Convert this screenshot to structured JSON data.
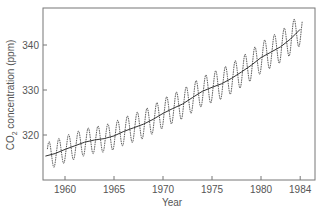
{
  "chart_data": {
    "type": "line",
    "title": "",
    "xlabel": "Year",
    "ylabel": "CO2 concentration (ppm)",
    "ylabel_parts": {
      "main": "CO",
      "sub": "2",
      "rest": " concentration (ppm)"
    },
    "xlim": [
      1957.75,
      1985.5
    ],
    "ylim": [
      310,
      348.5
    ],
    "x_ticks": [
      1960,
      1965,
      1970,
      1975,
      1980,
      1984
    ],
    "y_ticks": [
      320,
      330,
      340
    ],
    "grid": false,
    "legend": null,
    "series": [
      {
        "name": "Monthly CO2 (seasonal cycle)",
        "style": "dotted-line",
        "seasonal_amplitude_ppm": [
          3.0,
          3.0,
          3.0,
          3.0,
          3.0,
          3.0,
          3.0,
          3.1,
          3.1,
          3.2,
          3.2,
          3.2,
          3.3,
          3.3,
          3.3,
          3.3,
          3.3,
          3.4,
          3.4,
          3.4,
          3.4,
          3.4,
          3.5,
          3.5,
          3.5,
          3.6,
          3.6
        ]
      },
      {
        "name": "Trend",
        "style": "solid-line",
        "x": [
          1958,
          1959,
          1960,
          1961,
          1962,
          1963,
          1964,
          1965,
          1966,
          1967,
          1968,
          1969,
          1970,
          1971,
          1972,
          1973,
          1974,
          1975,
          1976,
          1977,
          1978,
          1979,
          1980,
          1981,
          1982,
          1983,
          1984
        ],
        "values": [
          315.3,
          315.9,
          316.8,
          317.6,
          318.4,
          318.9,
          319.2,
          319.8,
          320.8,
          321.6,
          322.4,
          323.5,
          324.8,
          325.9,
          326.9,
          328.3,
          329.7,
          330.6,
          331.4,
          332.6,
          334.0,
          335.5,
          337.2,
          338.4,
          339.6,
          341.3,
          343.5
        ]
      }
    ]
  }
}
